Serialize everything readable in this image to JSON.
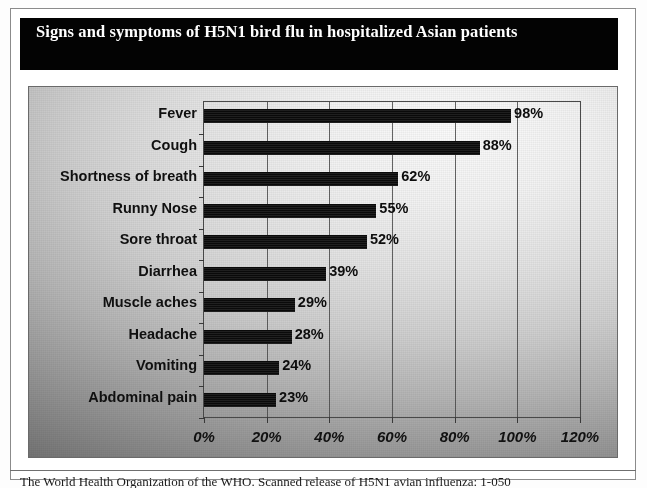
{
  "figure": {
    "title": "Signs and symptoms of H5N1 bird flu in hospitalized Asian patients",
    "caption": "The World Health Organization of the WHO. Scanned release of H5N1 avian influenza: 1-050"
  },
  "chart_data": {
    "type": "bar",
    "orientation": "horizontal",
    "title": "Signs and symptoms of H5N1 bird flu in hospitalized Asian patients",
    "xlabel": "",
    "ylabel": "",
    "categories": [
      "Fever",
      "Cough",
      "Shortness of breath",
      "Runny Nose",
      "Sore throat",
      "Diarrhea",
      "Muscle aches",
      "Headache",
      "Vomiting",
      "Abdominal pain"
    ],
    "values": [
      98,
      88,
      62,
      55,
      52,
      39,
      29,
      28,
      24,
      23
    ],
    "value_labels": [
      "98%",
      "88%",
      "62%",
      "55%",
      "52%",
      "39%",
      "29%",
      "28%",
      "24%",
      "23%"
    ],
    "xlim": [
      0,
      120
    ],
    "xticks": [
      0,
      20,
      40,
      60,
      80,
      100,
      120
    ],
    "xtick_labels": [
      "0%",
      "20%",
      "40%",
      "60%",
      "80%",
      "100%",
      "120%"
    ],
    "grid": "vertical",
    "legend": null,
    "bar_color": "#0a0a0a",
    "plot_background": "gradient-gray"
  }
}
